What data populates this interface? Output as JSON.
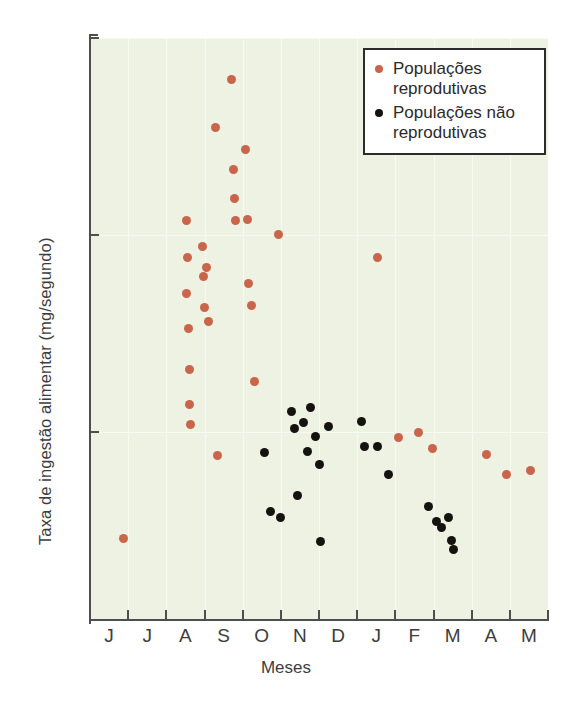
{
  "chart_data": {
    "type": "scatter",
    "title": "",
    "xlabel": "Meses",
    "ylabel": "Taxa de ingestão alimentar (mg/segundo)",
    "ytick_labels": [
      "0,5",
      "1,0",
      "1,5"
    ],
    "ytick_values": [
      0.5,
      1.0,
      1.5
    ],
    "ylim": [
      0.0,
      1.5
    ],
    "xtick_labels": [
      "J",
      "J",
      "A",
      "S",
      "O",
      "N",
      "D",
      "J",
      "F",
      "M",
      "A",
      "M"
    ],
    "xlim": [
      0,
      12
    ],
    "grid": true,
    "legend_position": "top-right",
    "colors": {
      "reproductive": "#c9654a",
      "non_reproductive": "#15120f",
      "plot_background": "#edf2e2",
      "gridline": "#f7faf0",
      "axis": "#4e4e4e",
      "text": "#3d3d3d"
    },
    "series": [
      {
        "name": "Populações reprodutivas",
        "color": "#c9654a",
        "points": [
          {
            "x": 0.87,
            "y": 0.229
          },
          {
            "x": 2.52,
            "y": 1.037
          },
          {
            "x": 2.55,
            "y": 0.942
          },
          {
            "x": 2.53,
            "y": 0.851
          },
          {
            "x": 2.58,
            "y": 0.762
          },
          {
            "x": 2.6,
            "y": 0.659
          },
          {
            "x": 2.62,
            "y": 0.57
          },
          {
            "x": 2.64,
            "y": 0.518
          },
          {
            "x": 2.95,
            "y": 0.971
          },
          {
            "x": 2.97,
            "y": 0.895
          },
          {
            "x": 2.99,
            "y": 0.816
          },
          {
            "x": 3.06,
            "y": 0.918
          },
          {
            "x": 3.1,
            "y": 0.781
          },
          {
            "x": 3.3,
            "y": 1.273
          },
          {
            "x": 3.33,
            "y": 0.44
          },
          {
            "x": 3.72,
            "y": 1.395
          },
          {
            "x": 3.76,
            "y": 1.167
          },
          {
            "x": 3.79,
            "y": 1.092
          },
          {
            "x": 3.82,
            "y": 1.037
          },
          {
            "x": 4.07,
            "y": 1.218
          },
          {
            "x": 4.12,
            "y": 1.04
          },
          {
            "x": 4.15,
            "y": 0.878
          },
          {
            "x": 4.22,
            "y": 0.822
          },
          {
            "x": 4.32,
            "y": 0.628
          },
          {
            "x": 4.95,
            "y": 1.002
          },
          {
            "x": 7.52,
            "y": 0.942
          },
          {
            "x": 8.08,
            "y": 0.485
          },
          {
            "x": 8.62,
            "y": 0.5
          },
          {
            "x": 8.98,
            "y": 0.458
          },
          {
            "x": 10.4,
            "y": 0.443
          },
          {
            "x": 10.92,
            "y": 0.392
          },
          {
            "x": 11.55,
            "y": 0.403
          }
        ]
      },
      {
        "name": "Populações não reprodutivas",
        "color": "#15120f",
        "points": [
          {
            "x": 4.58,
            "y": 0.447
          },
          {
            "x": 4.72,
            "y": 0.298
          },
          {
            "x": 4.98,
            "y": 0.283
          },
          {
            "x": 5.28,
            "y": 0.553
          },
          {
            "x": 5.36,
            "y": 0.508
          },
          {
            "x": 5.44,
            "y": 0.338
          },
          {
            "x": 5.6,
            "y": 0.523
          },
          {
            "x": 5.7,
            "y": 0.45
          },
          {
            "x": 5.78,
            "y": 0.563
          },
          {
            "x": 5.92,
            "y": 0.488
          },
          {
            "x": 6.02,
            "y": 0.418
          },
          {
            "x": 6.04,
            "y": 0.222
          },
          {
            "x": 6.26,
            "y": 0.513
          },
          {
            "x": 7.12,
            "y": 0.527
          },
          {
            "x": 7.2,
            "y": 0.462
          },
          {
            "x": 7.54,
            "y": 0.463
          },
          {
            "x": 7.82,
            "y": 0.392
          },
          {
            "x": 8.86,
            "y": 0.31
          },
          {
            "x": 9.08,
            "y": 0.272
          },
          {
            "x": 9.2,
            "y": 0.258
          },
          {
            "x": 9.38,
            "y": 0.284
          },
          {
            "x": 9.46,
            "y": 0.225
          },
          {
            "x": 9.52,
            "y": 0.202
          }
        ]
      }
    ]
  },
  "legend": {
    "items": [
      {
        "label": "Populações reprodutivas",
        "marker": "repro"
      },
      {
        "label": "Populações não reprodutivas",
        "marker": "nonrepro"
      }
    ]
  }
}
